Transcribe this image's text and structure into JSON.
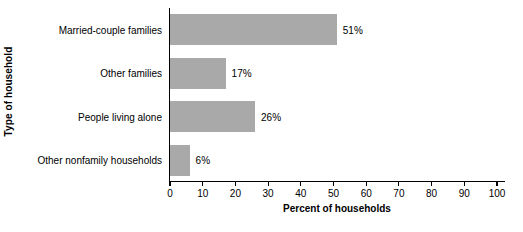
{
  "chart_data": {
    "type": "bar",
    "orientation": "horizontal",
    "title": "",
    "xlabel": "Percent of households",
    "ylabel": "Type of household",
    "categories": [
      "Married-couple families",
      "Other families",
      "People living alone",
      "Other nonfamily households"
    ],
    "values": [
      51,
      17,
      26,
      6
    ],
    "value_labels": [
      "51%",
      "17%",
      "26%",
      "6%"
    ],
    "xlim": [
      0,
      100
    ],
    "xticks": [
      0,
      10,
      20,
      30,
      40,
      50,
      60,
      70,
      80,
      90,
      100
    ],
    "xtick_labels": [
      "0",
      "10",
      "20",
      "30",
      "40",
      "50",
      "60",
      "70",
      "80",
      "90",
      "100"
    ],
    "grid": false,
    "legend": null,
    "bar_color": "#a9a9a9",
    "axis_color": "#000000",
    "background": "#ffffff"
  }
}
